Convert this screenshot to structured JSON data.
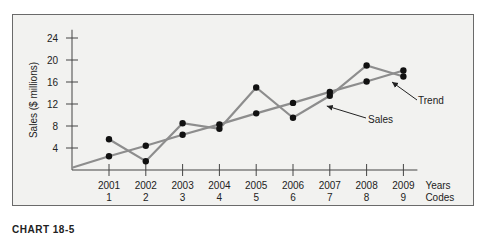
{
  "chart_data": {
    "type": "line",
    "title": "",
    "xlabel": "Years / Codes",
    "ylabel": "Sales ($ millions)",
    "ylim": [
      0,
      24
    ],
    "yticks": [
      4,
      8,
      12,
      16,
      20,
      24
    ],
    "categories": [
      "2001",
      "2002",
      "2003",
      "2004",
      "2005",
      "2006",
      "2007",
      "2008",
      "2009"
    ],
    "codes": [
      "1",
      "2",
      "3",
      "4",
      "5",
      "6",
      "7",
      "8",
      "9"
    ],
    "x_axis_labels": {
      "years": "Years",
      "codes": "Codes"
    },
    "series": [
      {
        "name": "Sales",
        "values": [
          5.6,
          1.6,
          8.5,
          7.5,
          15.0,
          9.5,
          13.5,
          19.0,
          17.0
        ]
      },
      {
        "name": "Trend",
        "values": [
          2.5,
          4.4,
          6.4,
          8.3,
          10.3,
          12.2,
          14.2,
          16.1,
          18.1
        ]
      }
    ],
    "annotations": [
      {
        "text": "Sales",
        "points_to": "Sales series near 2007"
      },
      {
        "text": "Trend",
        "points_to": "Trend series near 2009"
      }
    ],
    "grid": false,
    "legend": "none (inline arrow annotations)"
  },
  "caption": "CHART 18-5"
}
